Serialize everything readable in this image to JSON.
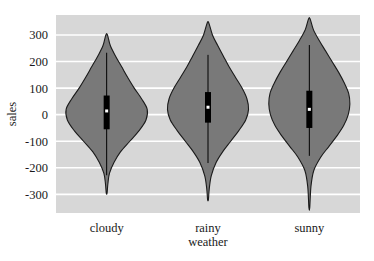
{
  "chart_data": {
    "type": "violin",
    "title": "",
    "xlabel": "weather",
    "ylabel": "sales",
    "categories": [
      "cloudy",
      "rainy",
      "sunny"
    ],
    "ylim": [
      -370,
      375
    ],
    "yticks": [
      300,
      200,
      100,
      0,
      -100,
      -200,
      -300
    ],
    "ytick_labels": [
      "300",
      "200",
      "100",
      "0",
      "-100",
      "-200",
      "-300"
    ],
    "grid": true,
    "grid_axis": "y",
    "legend": "none",
    "colors": {
      "plot_background": "#d7d7d7",
      "figure_background": "#ffffff",
      "gridline": "#ffffff",
      "violin_fill": "#797979",
      "violin_edge": "#1a1a1a",
      "box_fill": "#000000",
      "median_marker": "#ffffff",
      "whisker": "#000000"
    },
    "series": [
      {
        "name": "cloudy",
        "min": -295,
        "max": 300,
        "q1": -55,
        "q3": 72,
        "median": 14,
        "whisker_low": -228,
        "whisker_high": 233,
        "density_profile": [
          {
            "value": 300,
            "width": 0.02
          },
          {
            "value": 260,
            "width": 0.09
          },
          {
            "value": 220,
            "width": 0.22
          },
          {
            "value": 180,
            "width": 0.37
          },
          {
            "value": 140,
            "width": 0.52
          },
          {
            "value": 100,
            "width": 0.68
          },
          {
            "value": 60,
            "width": 0.86
          },
          {
            "value": 20,
            "width": 1.0
          },
          {
            "value": -20,
            "width": 0.97
          },
          {
            "value": -60,
            "width": 0.8
          },
          {
            "value": -100,
            "width": 0.57
          },
          {
            "value": -140,
            "width": 0.34
          },
          {
            "value": -180,
            "width": 0.18
          },
          {
            "value": -220,
            "width": 0.07
          },
          {
            "value": -260,
            "width": 0.03
          },
          {
            "value": -295,
            "width": 0.01
          }
        ]
      },
      {
        "name": "rainy",
        "min": -320,
        "max": 345,
        "q1": -30,
        "q3": 85,
        "median": 28,
        "whisker_low": -182,
        "whisker_high": 225,
        "density_profile": [
          {
            "value": 345,
            "width": 0.02
          },
          {
            "value": 300,
            "width": 0.11
          },
          {
            "value": 260,
            "width": 0.24
          },
          {
            "value": 220,
            "width": 0.38
          },
          {
            "value": 180,
            "width": 0.52
          },
          {
            "value": 140,
            "width": 0.68
          },
          {
            "value": 100,
            "width": 0.84
          },
          {
            "value": 60,
            "width": 0.96
          },
          {
            "value": 20,
            "width": 1.0
          },
          {
            "value": -20,
            "width": 0.93
          },
          {
            "value": -60,
            "width": 0.76
          },
          {
            "value": -100,
            "width": 0.56
          },
          {
            "value": -140,
            "width": 0.36
          },
          {
            "value": -180,
            "width": 0.2
          },
          {
            "value": -230,
            "width": 0.08
          },
          {
            "value": -280,
            "width": 0.03
          },
          {
            "value": -320,
            "width": 0.01
          }
        ]
      },
      {
        "name": "sunny",
        "min": -350,
        "max": 360,
        "q1": -50,
        "q3": 90,
        "median": 20,
        "whisker_low": -155,
        "whisker_high": 262,
        "density_profile": [
          {
            "value": 360,
            "width": 0.02
          },
          {
            "value": 320,
            "width": 0.1
          },
          {
            "value": 280,
            "width": 0.24
          },
          {
            "value": 240,
            "width": 0.4
          },
          {
            "value": 200,
            "width": 0.56
          },
          {
            "value": 160,
            "width": 0.72
          },
          {
            "value": 120,
            "width": 0.86
          },
          {
            "value": 80,
            "width": 0.97
          },
          {
            "value": 40,
            "width": 1.0
          },
          {
            "value": 0,
            "width": 0.96
          },
          {
            "value": -40,
            "width": 0.85
          },
          {
            "value": -80,
            "width": 0.68
          },
          {
            "value": -120,
            "width": 0.48
          },
          {
            "value": -160,
            "width": 0.28
          },
          {
            "value": -210,
            "width": 0.11
          },
          {
            "value": -270,
            "width": 0.04
          },
          {
            "value": -350,
            "width": 0.01
          }
        ]
      }
    ]
  }
}
